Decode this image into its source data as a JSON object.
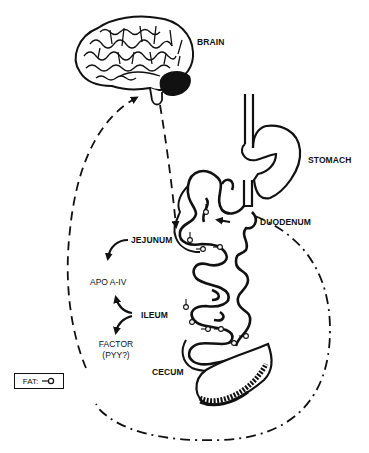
{
  "diagram": {
    "type": "anatomical-flow",
    "organs": {
      "brain": "BRAIN",
      "stomach": "STOMACH",
      "duodenum": "DUODENUM",
      "jejunum": "JEJUNUM",
      "ileum": "ILEUM",
      "cecum": "CECUM"
    },
    "factors": {
      "apo": "APO A-IV",
      "factor_line1": "FACTOR",
      "factor_line2": "(PYY?)"
    },
    "legend": {
      "label": "FAT:",
      "symbol": "-o"
    },
    "connections": [
      {
        "from": "BRAIN",
        "to": "JEJUNUM",
        "style": "dashed-arrow"
      },
      {
        "from": "JEJUNUM",
        "to": "APO A-IV",
        "style": "solid-arrow"
      },
      {
        "from": "ILEUM",
        "to": "APO A-IV",
        "style": "solid-arrow"
      },
      {
        "from": "ILEUM",
        "to": "FACTOR (PYY?)",
        "style": "solid-arrow"
      },
      {
        "from": "FACTOR (PYY?)",
        "to": "BRAIN",
        "style": "dashed-arrow"
      },
      {
        "from": "DUODENUM",
        "to": "CECUM",
        "style": "dash-dot-loop"
      }
    ],
    "colors": {
      "ink": "#111111",
      "background": "#ffffff"
    }
  }
}
